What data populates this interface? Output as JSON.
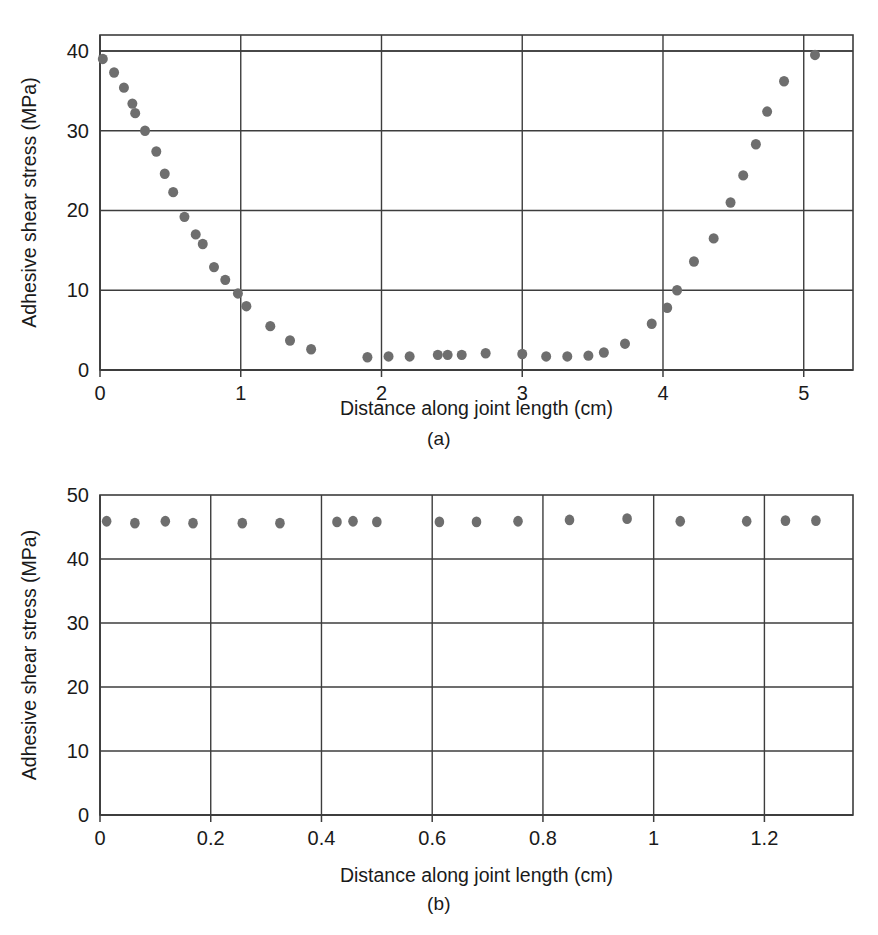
{
  "figure": {
    "panel_a_caption": "(a)",
    "panel_b_caption": "(b)"
  },
  "chart_data": [
    {
      "id": "panel-a",
      "type": "scatter",
      "title": "",
      "xlabel": "Distance along joint length (cm)",
      "ylabel": "Adhesive shear stress (MPa)",
      "xlim": [
        0,
        5.35
      ],
      "ylim": [
        0,
        42
      ],
      "xticks": [
        0,
        1,
        2,
        3,
        4,
        5
      ],
      "xtick_labels": [
        "0",
        "1",
        "2",
        "3",
        "4",
        "5"
      ],
      "yticks": [
        0,
        10,
        20,
        30,
        40
      ],
      "ytick_labels": [
        "0",
        "10",
        "20",
        "30",
        "40"
      ],
      "grid": true,
      "grid_axes": "both",
      "legend": "none",
      "marker_color": "#6e6e6e",
      "series": [
        {
          "name": "Adhesive shear stress",
          "points": [
            [
              0.02,
              39.0
            ],
            [
              0.1,
              37.3
            ],
            [
              0.17,
              35.4
            ],
            [
              0.23,
              33.4
            ],
            [
              0.25,
              32.2
            ],
            [
              0.32,
              30.0
            ],
            [
              0.4,
              27.4
            ],
            [
              0.46,
              24.6
            ],
            [
              0.52,
              22.3
            ],
            [
              0.6,
              19.2
            ],
            [
              0.68,
              17.0
            ],
            [
              0.73,
              15.8
            ],
            [
              0.81,
              12.9
            ],
            [
              0.89,
              11.3
            ],
            [
              0.98,
              9.6
            ],
            [
              1.04,
              8.0
            ],
            [
              1.21,
              5.5
            ],
            [
              1.35,
              3.7
            ],
            [
              1.5,
              2.6
            ],
            [
              1.9,
              1.6
            ],
            [
              2.05,
              1.7
            ],
            [
              2.2,
              1.7
            ],
            [
              2.4,
              1.9
            ],
            [
              2.47,
              1.9
            ],
            [
              2.57,
              1.9
            ],
            [
              2.74,
              2.1
            ],
            [
              3.0,
              2.0
            ],
            [
              3.17,
              1.7
            ],
            [
              3.32,
              1.7
            ],
            [
              3.47,
              1.8
            ],
            [
              3.58,
              2.2
            ],
            [
              3.73,
              3.3
            ],
            [
              3.92,
              5.8
            ],
            [
              4.03,
              7.8
            ],
            [
              4.1,
              10.0
            ],
            [
              4.22,
              13.6
            ],
            [
              4.36,
              16.5
            ],
            [
              4.48,
              21.0
            ],
            [
              4.57,
              24.4
            ],
            [
              4.66,
              28.3
            ],
            [
              4.74,
              32.4
            ],
            [
              4.86,
              36.2
            ],
            [
              5.08,
              39.5
            ]
          ]
        }
      ]
    },
    {
      "id": "panel-b",
      "type": "scatter",
      "title": "",
      "xlabel": "Distance along joint length (cm)",
      "ylabel": "Adhesive shear stress (MPa)",
      "xlim": [
        0,
        1.36
      ],
      "ylim": [
        0,
        50
      ],
      "xticks": [
        0,
        0.2,
        0.4,
        0.6,
        0.8,
        1.0,
        1.2
      ],
      "xtick_labels": [
        "0",
        "0.2",
        "0.4",
        "0.6",
        "0.8",
        "1",
        "1.2"
      ],
      "yticks": [
        0,
        10,
        20,
        30,
        40,
        50
      ],
      "ytick_labels": [
        "0",
        "10",
        "20",
        "30",
        "40",
        "50"
      ],
      "grid": true,
      "grid_axes": "both",
      "legend": "none",
      "marker_color": "#6e6e6e",
      "series": [
        {
          "name": "Adhesive shear stress",
          "points": [
            [
              0.012,
              45.9
            ],
            [
              0.063,
              45.6
            ],
            [
              0.118,
              45.9
            ],
            [
              0.168,
              45.6
            ],
            [
              0.257,
              45.6
            ],
            [
              0.325,
              45.6
            ],
            [
              0.428,
              45.8
            ],
            [
              0.457,
              45.9
            ],
            [
              0.5,
              45.8
            ],
            [
              0.613,
              45.8
            ],
            [
              0.68,
              45.8
            ],
            [
              0.755,
              45.9
            ],
            [
              0.848,
              46.1
            ],
            [
              0.952,
              46.3
            ],
            [
              1.048,
              45.9
            ],
            [
              1.168,
              45.9
            ],
            [
              1.238,
              46.0
            ],
            [
              1.293,
              46.0
            ]
          ]
        }
      ]
    }
  ]
}
